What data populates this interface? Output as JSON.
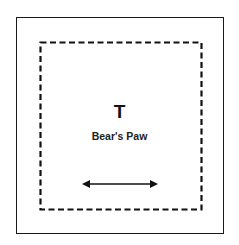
{
  "diagram": {
    "letter": "T",
    "label": "Bear's Paw",
    "arrow": "double-headed-horizontal-arrow",
    "border_outer": "solid",
    "border_inner": "dashed",
    "line_color": "#111111"
  }
}
